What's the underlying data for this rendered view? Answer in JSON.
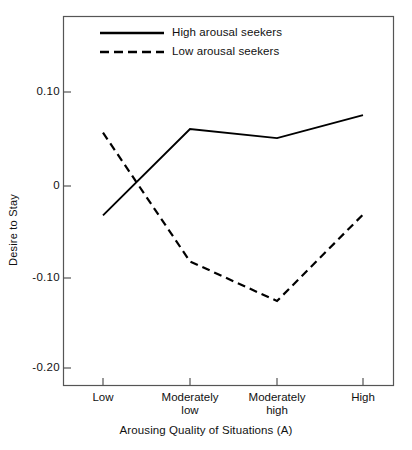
{
  "chart_data": {
    "type": "line",
    "title": "",
    "xlabel": "Arousing Quality of Situations (A)",
    "ylabel": "Desire to Stay",
    "categories": [
      "Low",
      "Moderately low",
      "Moderately high",
      "High"
    ],
    "category_lines": [
      [
        "Low",
        ""
      ],
      [
        "Moderately",
        "low"
      ],
      [
        "Moderately",
        "high"
      ],
      [
        "High",
        ""
      ]
    ],
    "ylim": [
      -0.235,
      0.185
    ],
    "yticks": [
      0.1,
      0,
      -0.1,
      -0.2
    ],
    "ytick_labels": [
      "0.10",
      "0",
      "-0.10",
      "-0.20"
    ],
    "grid": false,
    "legend_position": "top-center",
    "series": [
      {
        "name": "High arousal seekers",
        "style": "solid",
        "color": "#000000",
        "values": [
          -0.032,
          0.062,
          0.052,
          0.077
        ]
      },
      {
        "name": "Low arousal seekers",
        "style": "dashed",
        "color": "#000000",
        "values": [
          0.058,
          -0.082,
          -0.125,
          -0.031
        ]
      }
    ]
  },
  "legend": {
    "items": [
      {
        "label": "High arousal seekers",
        "style": "solid"
      },
      {
        "label": "Low arousal seekers",
        "style": "dashed"
      }
    ]
  },
  "axes": {
    "y_title": "Desire to Stay",
    "x_title": "Arousing Quality of Situations (A)",
    "y_tick_0": "0.10",
    "y_tick_1": "0",
    "y_tick_2": "-0.10",
    "y_tick_3": "-0.20",
    "x_tick_0_line1": "Low",
    "x_tick_0_line2": "",
    "x_tick_1_line1": "Moderately",
    "x_tick_1_line2": "low",
    "x_tick_2_line1": "Moderately",
    "x_tick_2_line2": "high",
    "x_tick_3_line1": "High",
    "x_tick_3_line2": ""
  }
}
